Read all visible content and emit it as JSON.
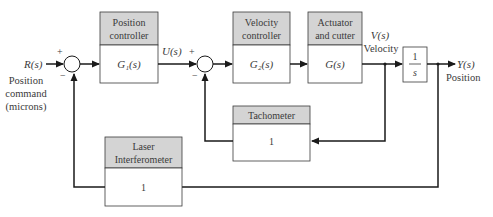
{
  "input": {
    "signal": "R(s)",
    "desc": [
      "Position",
      "command",
      "(microns)"
    ]
  },
  "output": {
    "signal": "Y(s)",
    "desc": "Position"
  },
  "intermediate": {
    "u": "U(s)",
    "v": "V(s)",
    "v_desc": "Velocity"
  },
  "blocks": {
    "position_controller": {
      "header": [
        "Position",
        "controller"
      ],
      "tf": "G₁(s)"
    },
    "velocity_controller": {
      "header": [
        "Velocity",
        "controller"
      ],
      "tf": "G₂(s)"
    },
    "actuator": {
      "header": [
        "Actuator",
        "and cutter"
      ],
      "tf": "G(s)"
    },
    "integrator": {
      "num": "1",
      "den": "s"
    },
    "tachometer": {
      "header": "Tachometer",
      "tf": "1"
    },
    "laser": {
      "header": [
        "Laser",
        "Interferometer"
      ],
      "tf": "1"
    }
  },
  "signs": {
    "plus": "+",
    "minus": "−"
  },
  "colors": {
    "header_fill": "#d4d4d4",
    "line": "#1a1a1a",
    "text": "#3a3a3a"
  }
}
